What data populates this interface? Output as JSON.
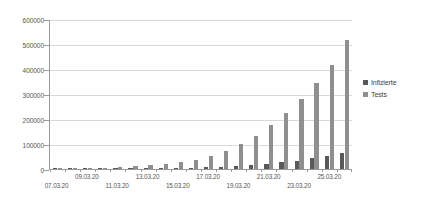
{
  "chart_data": {
    "type": "bar",
    "title": "",
    "xlabel": "",
    "ylabel": "",
    "ylim": [
      0,
      600000
    ],
    "ytick_labels": [
      "600000",
      "500000",
      "400000",
      "300000",
      "200000",
      "100000",
      "0"
    ],
    "ytick_values": [
      600000,
      500000,
      400000,
      300000,
      200000,
      100000,
      0
    ],
    "grid": true,
    "legend_position": "right",
    "categories": [
      "07.03.20",
      "08.03.20",
      "09.03.20",
      "10.03.20",
      "11.03.20",
      "12.03.20",
      "13.03.20",
      "14.03.20",
      "15.03.20",
      "16.03.20",
      "17.03.20",
      "18.03.20",
      "19.03.20",
      "20.03.20",
      "21.03.20",
      "22.03.20",
      "23.03.20",
      "24.03.20",
      "25.03.20",
      "26.03.20"
    ],
    "visible_tick_labels": [
      "07.03.20",
      "09.03.20",
      "11.03.20",
      "13.03.20",
      "15.03.20",
      "17.03.20",
      "19.03.20",
      "21.03.20",
      "23.03.20",
      "25.03.20"
    ],
    "series": [
      {
        "name": "Infizierte",
        "color": "#595959",
        "values": [
          680,
          900,
          1100,
          1300,
          1600,
          2000,
          2700,
          3600,
          4800,
          6000,
          7200,
          9300,
          12300,
          16700,
          21500,
          27400,
          33800,
          44100,
          52500,
          62400
        ]
      },
      {
        "name": "Tests",
        "color": "#8f8f8f",
        "values": [
          1000,
          2000,
          3500,
          5500,
          8000,
          11000,
          15500,
          21000,
          27000,
          38000,
          53000,
          73000,
          99000,
          133000,
          178000,
          223000,
          280000,
          343000,
          418000,
          518000
        ]
      }
    ]
  },
  "legend": {
    "items": [
      {
        "label": "Infizierte",
        "color": "#595959"
      },
      {
        "label": "Tests",
        "color": "#8f8f8f"
      }
    ]
  },
  "colors": {
    "infizierte": "#595959",
    "tests": "#8f8f8f",
    "gridline": "#d9d9d9",
    "axis": "#9a9a9a",
    "text": "#565656",
    "background": "#ffffff"
  }
}
